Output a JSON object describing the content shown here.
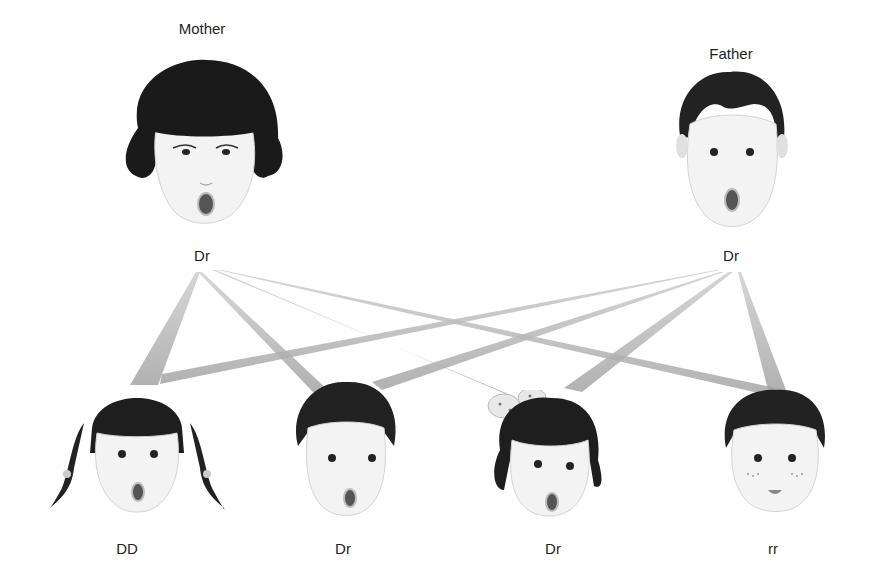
{
  "diagram": {
    "type": "inheritance-pedigree",
    "parents": [
      {
        "id": "mother",
        "label": "Mother",
        "genotype": "Dr",
        "x": 202,
        "label_y": 22,
        "genotype_y": 256
      },
      {
        "id": "father",
        "label": "Father",
        "genotype": "Dr",
        "x": 731,
        "label_y": 47,
        "genotype_y": 256
      }
    ],
    "children": [
      {
        "id": "child-1",
        "genotype": "DD",
        "x": 127,
        "genotype_y": 550,
        "description": "girl with pigtails"
      },
      {
        "id": "child-2",
        "genotype": "Dr",
        "x": 343,
        "genotype_y": 550,
        "description": "boy"
      },
      {
        "id": "child-3",
        "genotype": "Dr",
        "x": 553,
        "genotype_y": 550,
        "description": "girl with polka-dot bow"
      },
      {
        "id": "child-4",
        "genotype": "rr",
        "x": 773,
        "genotype_y": 550,
        "description": "boy with freckles, closed mouth"
      }
    ],
    "connections": [
      {
        "from": "mother",
        "to": "child-1"
      },
      {
        "from": "mother",
        "to": "child-2"
      },
      {
        "from": "mother",
        "to": "child-3"
      },
      {
        "from": "mother",
        "to": "child-4"
      },
      {
        "from": "father",
        "to": "child-1"
      },
      {
        "from": "father",
        "to": "child-2"
      },
      {
        "from": "father",
        "to": "child-3"
      },
      {
        "from": "father",
        "to": "child-4"
      }
    ],
    "colors": {
      "line": "#a8a8a8",
      "line_light": "#d6d6d6",
      "hair": "#1c1c1c",
      "skin": "#f2f2f2"
    }
  }
}
